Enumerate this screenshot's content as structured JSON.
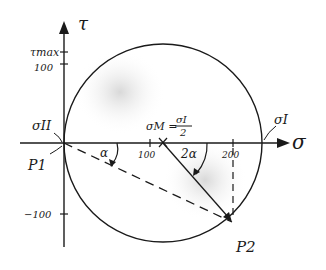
{
  "diagram": {
    "axes": {
      "horizontal_label": "σ",
      "vertical_label": "τ",
      "horizontal_ticks": [
        "100",
        "200"
      ],
      "vertical_ticks": [
        "τmax",
        "100",
        "−100"
      ]
    },
    "labels": {
      "sigma_II": "σII",
      "sigma_I": "σI",
      "sigma_M": "σM = σI / 2",
      "sigma_M_lhs": "σM =",
      "sigma_M_num": "σI",
      "sigma_M_den": "2",
      "P1": "P1",
      "P2": "P2",
      "angle_alpha": "α",
      "angle_2alpha": "2α"
    },
    "colors": {
      "ink": "#1a1a1a",
      "shade": "#d9d9d9",
      "paper": "#ffffff"
    }
  }
}
